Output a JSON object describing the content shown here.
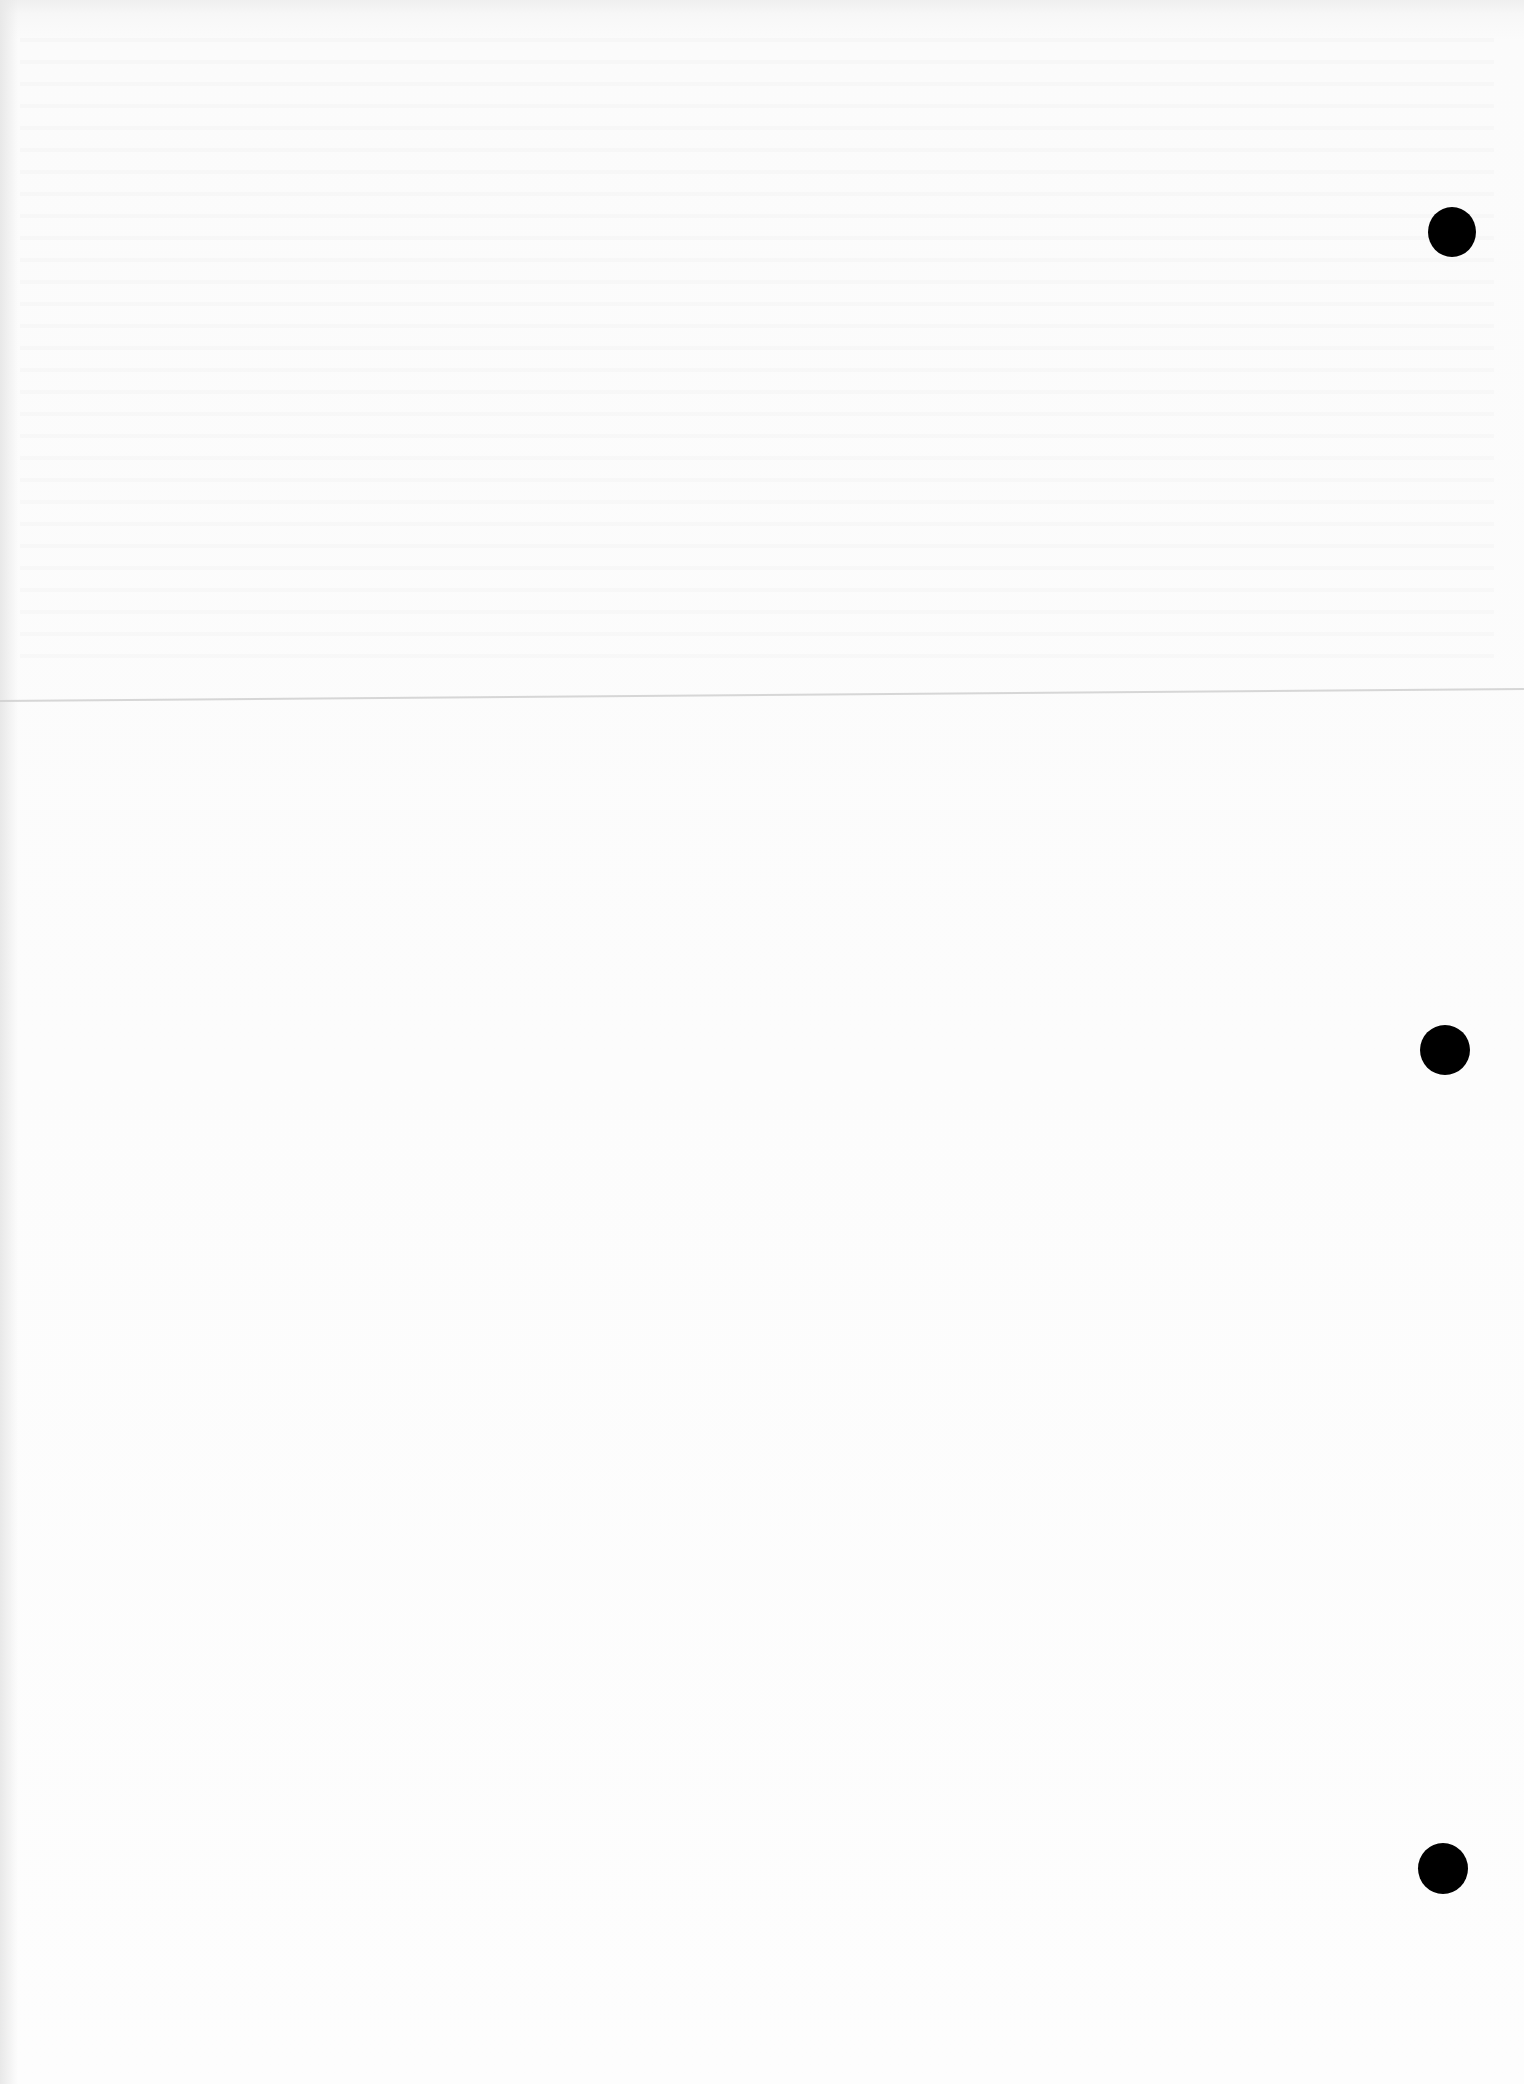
{
  "document": {
    "type": "blank scanned page",
    "text_content": [],
    "features": {
      "punch_holes": 3,
      "fold_line": true
    }
  },
  "colors": {
    "paper": "#fbfbfb",
    "punch_hole": "#000000",
    "fold_line": "#cfcfcf"
  }
}
